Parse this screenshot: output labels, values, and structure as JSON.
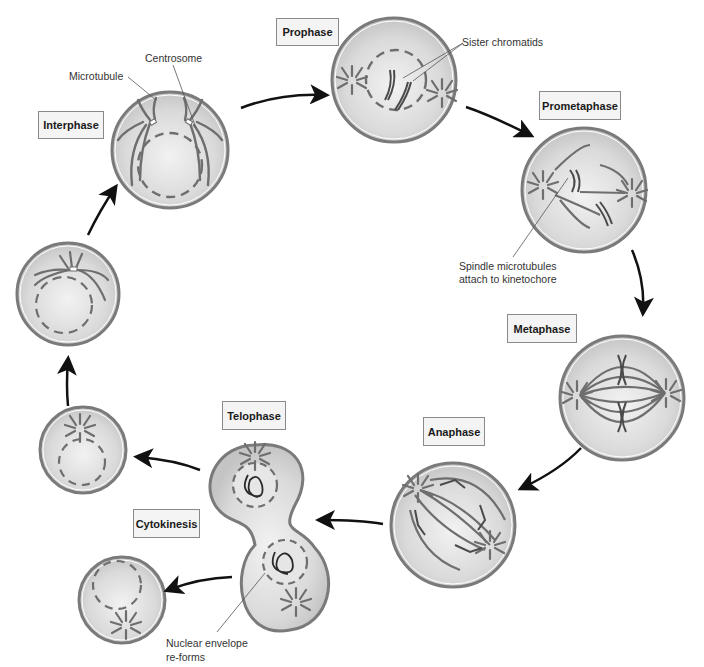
{
  "colors": {
    "cell_fill": "#d9d9d9",
    "cell_fill_light": "#f0f0f0",
    "outline": "#7a7a7a",
    "microtubule": "#6e6e6e",
    "chromosome": "#4a4a4a",
    "arrow": "#111111",
    "label_bg": "#f4f4f4",
    "label_border": "#8a8a8a"
  },
  "stages": [
    {
      "id": "interphase",
      "label": "Interphase"
    },
    {
      "id": "prophase",
      "label": "Prophase"
    },
    {
      "id": "prometaphase",
      "label": "Prometaphase"
    },
    {
      "id": "metaphase",
      "label": "Metaphase"
    },
    {
      "id": "anaphase",
      "label": "Anaphase"
    },
    {
      "id": "telophase",
      "label": "Telophase"
    },
    {
      "id": "cytokinesis",
      "label": "Cytokinesis"
    }
  ],
  "annotations": {
    "microtubule": "Microtubule",
    "centrosome": "Centrosome",
    "sister_chromatids": "Sister chromatids",
    "spindle_line1": "Spindle microtubules",
    "spindle_line2": "attach to kinetochore",
    "nuclear_line1": "Nuclear envelope",
    "nuclear_line2": "re-forms"
  }
}
